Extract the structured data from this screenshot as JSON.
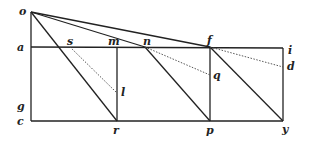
{
  "diagram": {
    "type": "geometric-figure",
    "points": {
      "o": {
        "x": 31,
        "y": 12
      },
      "a": {
        "x": 31,
        "y": 47
      },
      "g": {
        "x": 31,
        "y": 107
      },
      "c": {
        "x": 31,
        "y": 121
      },
      "s": {
        "x": 70,
        "y": 47
      },
      "m": {
        "x": 117,
        "y": 47
      },
      "n": {
        "x": 145,
        "y": 47
      },
      "f": {
        "x": 210,
        "y": 47
      },
      "i": {
        "x": 283,
        "y": 50
      },
      "d": {
        "x": 283,
        "y": 67
      },
      "l": {
        "x": 117,
        "y": 93
      },
      "q": {
        "x": 210,
        "y": 75
      },
      "r": {
        "x": 117,
        "y": 121
      },
      "p": {
        "x": 210,
        "y": 121
      },
      "y": {
        "x": 283,
        "y": 121
      }
    },
    "labels": {
      "o": "o",
      "a": "a",
      "g": "g",
      "c": "c",
      "s": "s",
      "m": "m",
      "n": "n",
      "f": "f",
      "i": "i",
      "d": "d",
      "l": "l",
      "q": "q",
      "r": "r",
      "p": "p",
      "y": "y"
    },
    "solid_lines": [
      [
        "o",
        "c"
      ],
      [
        "a",
        "i"
      ],
      [
        "c",
        "y"
      ],
      [
        "i",
        "y"
      ],
      [
        "o",
        "f"
      ],
      [
        "o",
        "n"
      ],
      [
        "o",
        "r"
      ],
      [
        "m",
        "r"
      ],
      [
        "f",
        "p"
      ],
      [
        "n",
        "p"
      ],
      [
        "f",
        "y"
      ]
    ],
    "dotted_lines": [
      [
        "s",
        "l"
      ],
      [
        "n",
        "q"
      ],
      [
        "f",
        "d"
      ]
    ]
  }
}
